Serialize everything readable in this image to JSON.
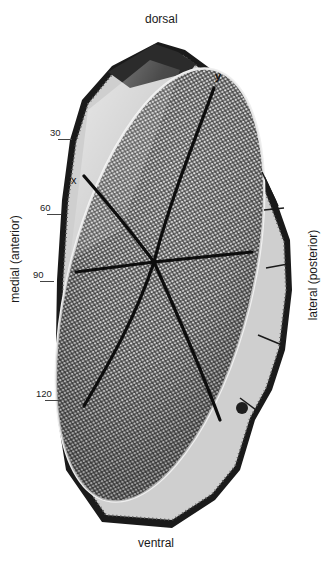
{
  "figure": {
    "orientation_labels": {
      "top": "dorsal",
      "bottom": "ventral",
      "left": "medial (anterior)",
      "right": "lateral (posterior)"
    },
    "markers": {
      "x": "x",
      "y": "y"
    },
    "scale_ticks": [
      {
        "label": "30",
        "y": 137
      },
      {
        "label": "60",
        "y": 211
      },
      {
        "label": "90",
        "y": 279
      },
      {
        "label": "120",
        "y": 397
      }
    ],
    "colors": {
      "background": "#ffffff",
      "lens_field": "#9a9a9a",
      "dark_border": "#141414",
      "rim": "#d8d8d8",
      "dividing_lines": "#0d0d0d"
    }
  }
}
